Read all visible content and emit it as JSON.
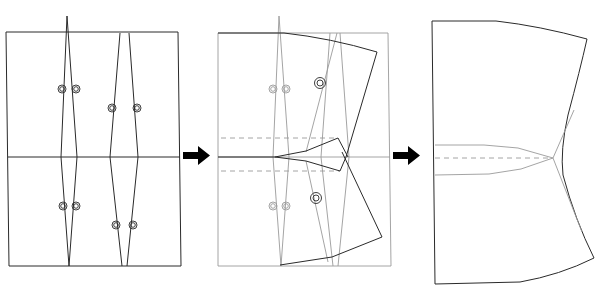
{
  "diagram": {
    "type": "sewing-pattern-dart-manipulation",
    "caption": "",
    "steps": [
      {
        "label": "original-pattern-with-darts",
        "panel": 1
      },
      {
        "label": "pivot-and-close-darts",
        "panel": 2
      },
      {
        "label": "final-pattern-with-transferred-dart",
        "panel": 3
      }
    ],
    "arrows": [
      {
        "from": 1,
        "to": 2,
        "direction": "right"
      },
      {
        "from": 2,
        "to": 3,
        "direction": "right"
      }
    ],
    "colors": {
      "outline": "#2a2a2a",
      "construction": "#9a9a9a",
      "arrow": "#000000",
      "background": "#ffffff"
    },
    "panels": {
      "panel1": {
        "frame": {
          "x1": 6,
          "y1": 32,
          "x2": 178,
          "y2": 266
        },
        "center_line_y": 157,
        "darts": [
          {
            "name": "front-dart",
            "top": [
              [
                65,
                17
              ],
              [
                69,
                17
              ]
            ],
            "waist": [
              [
                61,
                157
              ],
              [
                77,
                157
              ]
            ],
            "bottom": [
              69,
              266
            ]
          },
          {
            "name": "side-dart",
            "top": [
              [
                120,
                33
              ],
              [
                129,
                33
              ]
            ],
            "waist": [
              [
                110,
                157
              ],
              [
                138,
                157
              ]
            ],
            "bottom": [
              [
                122,
                266
              ],
              [
                127,
                266
              ]
            ]
          }
        ],
        "markers": [
          [
            62,
            89
          ],
          [
            76,
            89
          ],
          [
            112,
            108
          ],
          [
            137,
            108
          ],
          [
            63,
            206
          ],
          [
            76,
            206
          ],
          [
            116,
            225
          ],
          [
            133,
            225
          ]
        ]
      },
      "panel2": {
        "frame": {
          "x1": 218,
          "y1": 33,
          "x2": 388,
          "y2": 266
        },
        "markers_gray": [
          [
            273,
            89
          ],
          [
            286,
            89
          ],
          [
            273,
            206
          ],
          [
            286,
            206
          ]
        ],
        "markers_dark": [
          [
            320,
            83
          ],
          [
            316,
            198
          ]
        ]
      },
      "panel3": {
        "corners": {
          "top_left": [
            432,
            21
          ],
          "top_right": [
            587,
            39
          ],
          "bottom_right": [
            594,
            258
          ],
          "bottom_left": [
            435,
            284
          ]
        },
        "junction": [
          553,
          158
        ]
      }
    }
  }
}
